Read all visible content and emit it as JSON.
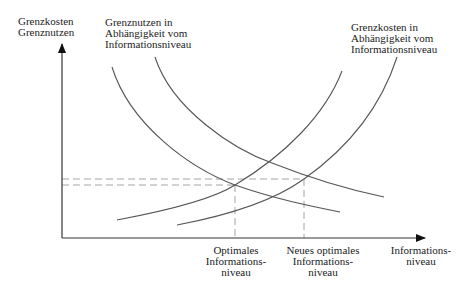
{
  "axes": {
    "y_label": "Grenzkosten\nGrenznutzen",
    "x_label": "Informations-\nniveau"
  },
  "curves": {
    "benefit_label": "Grenznutzen in\nAbhängigkeit vom\nInformationsniveau",
    "cost_label": "Grenzkosten in\nAbhängigkeit vom\nInformationsniveau"
  },
  "markers": {
    "optimal_label": "Optimales\nInformations-\nniveau",
    "new_optimal_label": "Neues optimales\nInformations-\nniveau"
  },
  "colors": {
    "line": "#555555",
    "axis": "#333333",
    "dashed": "#9a9a9a",
    "text": "#222222"
  }
}
